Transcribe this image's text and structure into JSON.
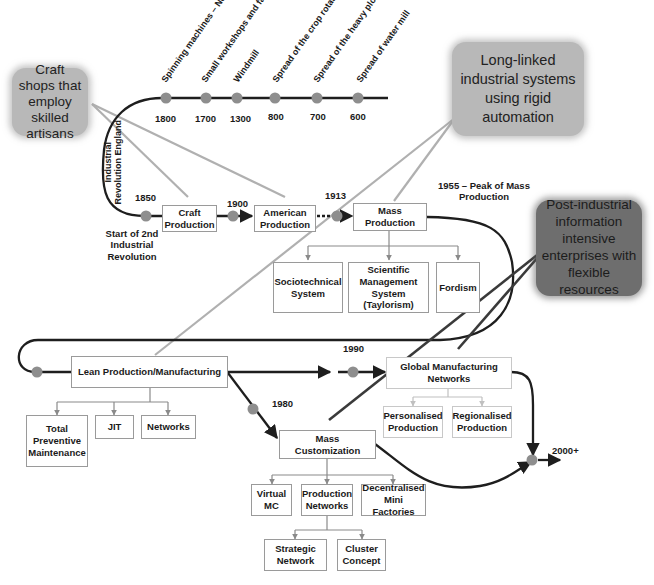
{
  "colors": {
    "timeline_line": "#1e1e1e",
    "milestone_dot": "#8e8e8e",
    "callout_light": "#b8b8b8",
    "callout_dark": "#6e6e6e",
    "callout_line_light": "#b0b0b0",
    "callout_line_dark": "#3a3a3a",
    "box_border": "#9a9a9a",
    "connector": "#8a8a8a"
  },
  "callouts": {
    "craft": "Craft shops that employ skilled artisans",
    "long_linked": "Long-linked industrial systems using rigid automation",
    "post_industrial": "Post-industrial information intensive enterprises with flexible resources"
  },
  "early_timeline": {
    "events": [
      {
        "label": "Spinning machines – New factories",
        "year": "1800"
      },
      {
        "label": "Small workshops and farm workers",
        "year": "1700"
      },
      {
        "label": "Windmill",
        "year": "1300"
      },
      {
        "label": "Spread of the crop rotation system",
        "year": "800"
      },
      {
        "label": "Spread of the heavy plow",
        "year": "700"
      },
      {
        "label": "Spread of water mill",
        "year": "600"
      }
    ],
    "vertical_label": "Industrial Revolution England"
  },
  "milestones": {
    "y1850": "1850",
    "start_second_rev": "Start of 2nd Industrial Revolution",
    "y1900": "1900",
    "y1913": "1913",
    "y1955": "1955 – Peak of Mass Production",
    "y1990": "1990",
    "y1980": "1980",
    "y2000": "2000+"
  },
  "boxes": {
    "craft_production": "Craft Production",
    "american_production": "American Production",
    "mass_production": "Mass Production",
    "sociotechnical": "Sociotechnical System",
    "scientific_mgmt": "Scientific Management System (Taylorism)",
    "fordism": "Fordism",
    "lean": "Lean Production/Manufacturing",
    "tpm": "Total Preventive Maintenance",
    "jit": "JIT",
    "networks": "Networks",
    "global_mfg": "Global Manufacturing Networks",
    "personalised": "Personalised Production",
    "regionalised": "Regionalised Production",
    "mass_customization": "Mass Customization",
    "virtual_mc": "Virtual MC",
    "production_networks": "Production Networks",
    "decentralised": "Decentralised Mini Factories",
    "strategic_network": "Strategic Network",
    "cluster_concept": "Cluster Concept"
  }
}
